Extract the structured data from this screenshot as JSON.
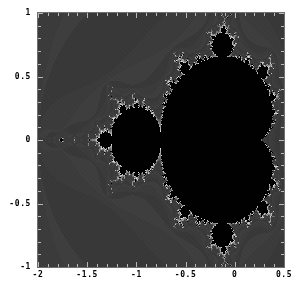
{
  "figure": {
    "background_color": "#ffffff",
    "frame_color": "#6e6e6e",
    "tick_color": "#b9b9b9",
    "label_color": "#000000"
  },
  "chart_data": {
    "type": "heatmap",
    "title": "",
    "subtitle": "",
    "xlabel": "",
    "ylabel": "",
    "xlim": [
      -2,
      0.5
    ],
    "ylim": [
      -1,
      1
    ],
    "grid": false,
    "legend": "none",
    "colormap": {
      "interior": "#000000",
      "exterior": "#3b3b3b",
      "boundary_highlight": "#e8e8e8"
    },
    "max_iterations": 50,
    "x_ticks": [
      -2,
      -1.5,
      -1,
      -0.5,
      0,
      0.5
    ],
    "x_tick_labels": [
      "-2",
      "-1.5",
      "-1",
      "-0.5",
      "0",
      "0.5"
    ],
    "y_ticks": [
      -1,
      -0.5,
      0,
      0.5,
      1
    ],
    "y_tick_labels": [
      "-1",
      "-0.5",
      "0",
      "0.5",
      "1"
    ],
    "x_minor_tick_step": 0.1,
    "y_minor_tick_step": 0.1,
    "features": [
      {
        "name": "main-cardioid",
        "center_x": -0.15,
        "center_y": 0.0,
        "extent": 0.75
      },
      {
        "name": "period-2-bulb",
        "center_x": -1.0,
        "center_y": 0.0,
        "radius": 0.25
      },
      {
        "name": "period-3-bulb-upper",
        "center_x": -0.125,
        "center_y": 0.74,
        "radius": 0.095
      },
      {
        "name": "period-3-bulb-lower",
        "center_x": -0.125,
        "center_y": -0.74,
        "radius": 0.095
      },
      {
        "name": "period-4-bulb-left",
        "center_x": -1.31,
        "center_y": 0.0,
        "radius": 0.06
      },
      {
        "name": "mini-mandelbrot-antenna",
        "center_x": -1.75,
        "center_y": 0.0,
        "radius": 0.03
      }
    ]
  }
}
